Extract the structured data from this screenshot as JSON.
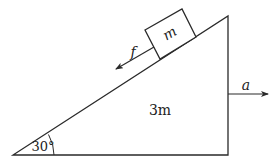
{
  "diagram": {
    "colors": {
      "line": "#2a2a2a",
      "background": "#ffffff"
    },
    "wedge": {
      "label": "3m",
      "angle_label": "30°",
      "vertices": [
        [
          13,
          155
        ],
        [
          228,
          155
        ],
        [
          228,
          16
        ]
      ]
    },
    "block": {
      "label": "m",
      "corners": [
        [
          145,
          30
        ],
        [
          182,
          9
        ],
        [
          196,
          37
        ],
        [
          160,
          59
        ]
      ]
    },
    "friction": {
      "label": "f",
      "direction": "down the incline"
    },
    "acceleration": {
      "label": "a",
      "direction": "right"
    }
  }
}
